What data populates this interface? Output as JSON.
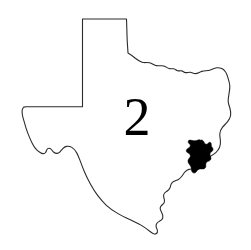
{
  "figure": {
    "kind": "map",
    "background_color": "#ffffff",
    "width": 251,
    "height": 250
  },
  "map": {
    "state_name": "Texas",
    "outline_color": "#2b2b2b",
    "fill_color": "#ffffff",
    "stroke_width": 1.1
  },
  "district_label": {
    "text": "2",
    "color": "#000000",
    "font_size": 54,
    "x": 137,
    "y": 135
  },
  "highlight": {
    "name": "highlighted-county",
    "fill_color": "#000000",
    "location_hint": "Gulf coast, southeast Texas"
  }
}
